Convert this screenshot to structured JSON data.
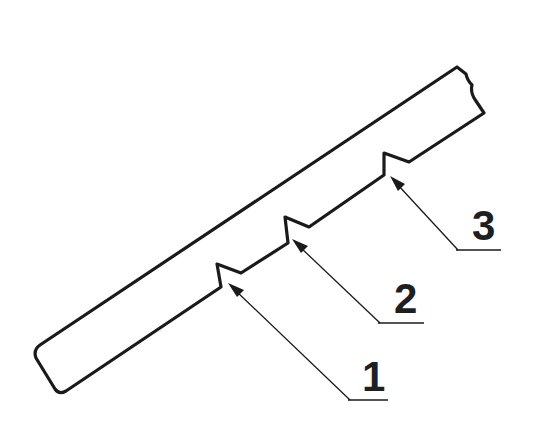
{
  "diagram": {
    "type": "technical-illustration",
    "colors": {
      "line": "#1a1a1a",
      "background": "#ffffff"
    },
    "callouts": [
      {
        "id": 1,
        "label": "1",
        "target": "first notch (lower-left)"
      },
      {
        "id": 2,
        "label": "2",
        "target": "second notch (middle)"
      },
      {
        "id": 3,
        "label": "3",
        "target": "third notch (upper-right)"
      }
    ]
  }
}
